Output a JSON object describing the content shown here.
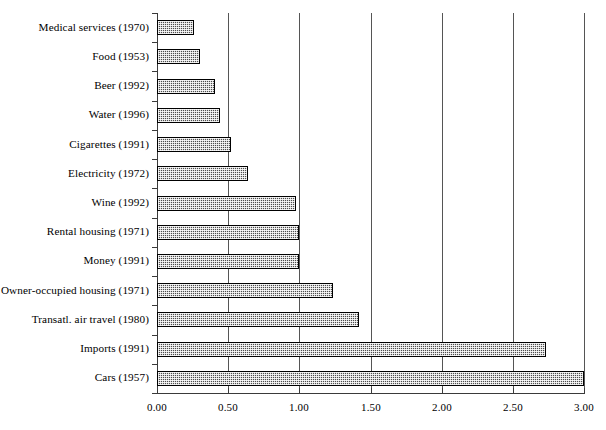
{
  "chart_data": {
    "type": "bar",
    "orientation": "horizontal",
    "title": "",
    "subtitle": "",
    "xlabel": "",
    "ylabel": "",
    "xlim": [
      0.0,
      3.0
    ],
    "grid": true,
    "grid_axis": "x",
    "legend": false,
    "xticks": [
      0.0,
      0.5,
      1.0,
      1.5,
      2.0,
      2.5,
      3.0
    ],
    "xtick_labels": [
      "0.00",
      "0.50",
      "1.00",
      "1.50",
      "2.00",
      "2.50",
      "3.00"
    ],
    "categories": [
      "Medical services (1970)",
      "Food (1953)",
      "Beer (1992)",
      "Water (1996)",
      "Cigarettes (1991)",
      "Electricity (1972)",
      "Wine (1992)",
      "Rental housing (1971)",
      "Money (1991)",
      "Owner-occupied housing (1971)",
      "Transatl. air travel (1980)",
      "Imports (1991)",
      "Cars (1957)"
    ],
    "values": [
      0.26,
      0.3,
      0.41,
      0.44,
      0.52,
      0.64,
      0.98,
      1.0,
      1.0,
      1.24,
      1.42,
      2.73,
      3.0
    ],
    "series": [
      {
        "name": "Price elasticity",
        "values": [
          0.26,
          0.3,
          0.41,
          0.44,
          0.52,
          0.64,
          0.98,
          1.0,
          1.0,
          1.24,
          1.42,
          2.73,
          3.0
        ]
      }
    ],
    "colors": {
      "bar_fill": "#4e4e4e",
      "bar_edge": "#000000",
      "gridline": "#555555",
      "axis": "#3a3a3a",
      "background": "#ffffff",
      "text": "#000000"
    }
  }
}
